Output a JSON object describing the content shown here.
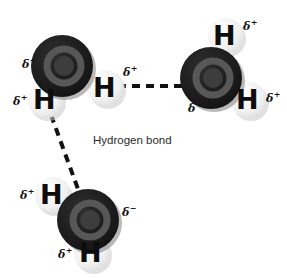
{
  "diagram": {
    "caption": "Hydrogen bond",
    "caption_position": {
      "x": 93,
      "y": 135
    },
    "canvas": {
      "width": 287,
      "height": 278
    },
    "colors": {
      "background": "#ffffff",
      "oxygen_outer": "#1c1c1c",
      "oxygen_ring": "#565656",
      "oxygen_core": "#3d3d3d",
      "oxygen_shadow": "#8a8a8a",
      "hydrogen_sphere": "#f2f2f2",
      "hydrogen_shadow": "#c9c9c9",
      "label_text": "#0d0d0d",
      "bond_line": "#111111",
      "caption_text": "#2b2b2b"
    }
  },
  "molecules": [
    {
      "name": "water-top-left",
      "oxygen": {
        "cx": 62,
        "cy": 66,
        "r": 31,
        "charge": "δ",
        "charge_sign": "−",
        "label_x": 22,
        "label_y": 56
      },
      "hydrogens": [
        {
          "name": "hydrogen-lower-left",
          "cx": 46,
          "cy": 100,
          "r": 18,
          "glyph": "H",
          "glyph_x": 33,
          "glyph_y": 86,
          "charge": "δ",
          "charge_sign": "+",
          "label_x": 13,
          "label_y": 93
        },
        {
          "name": "hydrogen-right",
          "cx": 106,
          "cy": 88,
          "r": 18,
          "glyph": "H",
          "glyph_x": 93,
          "glyph_y": 74,
          "charge": "δ",
          "charge_sign": "+",
          "label_x": 123,
          "label_y": 64
        }
      ]
    },
    {
      "name": "water-top-right",
      "oxygen": {
        "cx": 211,
        "cy": 78,
        "r": 31,
        "charge": "δ",
        "charge_sign": "−",
        "label_x": 188,
        "label_y": 100
      },
      "hydrogens": [
        {
          "name": "hydrogen-top",
          "cx": 226,
          "cy": 36,
          "r": 18,
          "glyph": "H",
          "glyph_x": 213,
          "glyph_y": 22,
          "charge": "δ",
          "charge_sign": "+",
          "label_x": 243,
          "label_y": 18
        },
        {
          "name": "hydrogen-right",
          "cx": 249,
          "cy": 100,
          "r": 18,
          "glyph": "H",
          "glyph_x": 236,
          "glyph_y": 86,
          "charge": "δ",
          "charge_sign": "+",
          "label_x": 266,
          "label_y": 90
        }
      ]
    },
    {
      "name": "water-bottom-left",
      "oxygen": {
        "cx": 88,
        "cy": 220,
        "r": 31,
        "charge": "δ",
        "charge_sign": "−",
        "label_x": 122,
        "label_y": 204
      },
      "hydrogens": [
        {
          "name": "hydrogen-left",
          "cx": 53,
          "cy": 195,
          "r": 18,
          "glyph": "H",
          "glyph_x": 40,
          "glyph_y": 181,
          "charge": "δ",
          "charge_sign": "+",
          "label_x": 20,
          "label_y": 187
        },
        {
          "name": "hydrogen-bottom",
          "cx": 92,
          "cy": 253,
          "r": 18,
          "glyph": "H",
          "glyph_x": 79,
          "glyph_y": 239,
          "charge": "δ",
          "charge_sign": "+",
          "label_x": 58,
          "label_y": 246
        }
      ]
    }
  ],
  "bonds": [
    {
      "name": "hydrogen-bond-horizontal",
      "x1": 118,
      "y1": 86,
      "x2": 182,
      "y2": 86
    },
    {
      "name": "hydrogen-bond-diagonal",
      "x1": 51,
      "y1": 115,
      "x2": 78,
      "y2": 189
    }
  ]
}
